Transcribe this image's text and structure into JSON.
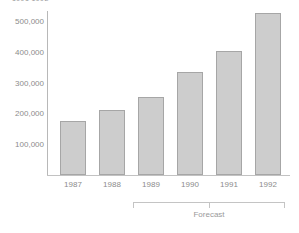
{
  "chart_data": {
    "type": "bar",
    "title": "1991 1992",
    "categories": [
      "1987",
      "1988",
      "1989",
      "1990",
      "1991",
      "1992"
    ],
    "values": [
      175000,
      211000,
      254000,
      335000,
      403000,
      527000
    ],
    "xlabel": "",
    "ylabel": "",
    "ylim": [
      0,
      560000
    ],
    "ytick_labels": [
      "500,000",
      "400,000",
      "300,000",
      "200,000",
      "100,000"
    ],
    "ytick_values": [
      500000,
      400000,
      300000,
      200000,
      100000
    ],
    "grid": false,
    "legend": null,
    "annotations": [
      {
        "text": "Forecast",
        "spans_categories": [
          "1989",
          "1990",
          "1991",
          "1992"
        ],
        "style": "bracket-below-axis"
      }
    ],
    "colors": {
      "bar_fill": "#cdcdcd",
      "bar_border": "#a6a6a6",
      "axis": "#b8b8b8",
      "text": "#8c8c8c",
      "background": "#ffffff"
    }
  }
}
